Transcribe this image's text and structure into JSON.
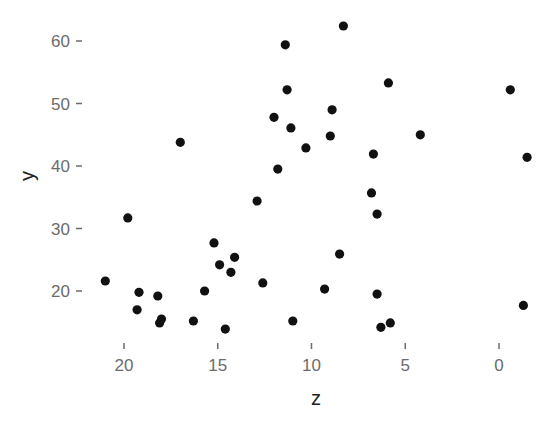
{
  "chart_data": {
    "type": "scatter",
    "title": "",
    "xlabel": "z",
    "ylabel": "y",
    "x_reversed": true,
    "xlim": [
      21.2,
      -1.6
    ],
    "ylim": [
      12.5,
      63.5
    ],
    "x_ticks": [
      20,
      15,
      10,
      5,
      0
    ],
    "y_ticks": [
      20,
      30,
      40,
      50,
      60
    ],
    "grid": false,
    "legend": null,
    "point_color": "#111111",
    "points": [
      {
        "x": 8.3,
        "y": 62.4
      },
      {
        "x": 11.4,
        "y": 59.4
      },
      {
        "x": 11.3,
        "y": 52.2
      },
      {
        "x": 5.9,
        "y": 53.3
      },
      {
        "x": -0.6,
        "y": 52.2
      },
      {
        "x": 8.9,
        "y": 49.0
      },
      {
        "x": 12.0,
        "y": 47.8
      },
      {
        "x": 11.1,
        "y": 46.1
      },
      {
        "x": 9.0,
        "y": 44.8
      },
      {
        "x": 4.2,
        "y": 45.0
      },
      {
        "x": 17.0,
        "y": 43.8
      },
      {
        "x": 10.3,
        "y": 42.9
      },
      {
        "x": 6.7,
        "y": 41.9
      },
      {
        "x": -1.5,
        "y": 41.4
      },
      {
        "x": 11.8,
        "y": 39.5
      },
      {
        "x": 6.8,
        "y": 35.7
      },
      {
        "x": 12.9,
        "y": 34.4
      },
      {
        "x": 6.5,
        "y": 32.3
      },
      {
        "x": 19.8,
        "y": 31.7
      },
      {
        "x": 15.2,
        "y": 27.7
      },
      {
        "x": 8.5,
        "y": 25.9
      },
      {
        "x": 14.1,
        "y": 25.4
      },
      {
        "x": 14.9,
        "y": 24.2
      },
      {
        "x": 14.3,
        "y": 23.0
      },
      {
        "x": 21.0,
        "y": 21.6
      },
      {
        "x": 12.6,
        "y": 21.3
      },
      {
        "x": 9.3,
        "y": 20.3
      },
      {
        "x": 15.7,
        "y": 20.0
      },
      {
        "x": 19.2,
        "y": 19.8
      },
      {
        "x": 6.5,
        "y": 19.5
      },
      {
        "x": 18.2,
        "y": 19.2
      },
      {
        "x": -1.3,
        "y": 17.7
      },
      {
        "x": 19.3,
        "y": 17.0
      },
      {
        "x": 18.0,
        "y": 15.5
      },
      {
        "x": 16.3,
        "y": 15.2
      },
      {
        "x": 11.0,
        "y": 15.2
      },
      {
        "x": 18.1,
        "y": 14.9
      },
      {
        "x": 5.8,
        "y": 14.9
      },
      {
        "x": 6.3,
        "y": 14.2
      },
      {
        "x": 14.6,
        "y": 13.9
      }
    ]
  },
  "plot_area": {
    "left": 86,
    "top": 14,
    "right": 540,
    "bottom": 338
  },
  "mapping": {
    "x_px_at_20": 124,
    "x_px_at_0": 499,
    "y_px_at_60": 41,
    "y_px_at_20": 291
  }
}
